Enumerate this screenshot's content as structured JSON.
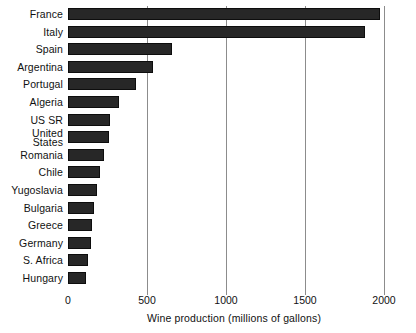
{
  "chart_data": {
    "type": "bar",
    "orientation": "horizontal",
    "title": "",
    "xlabel": "Wine production (millions of gallons)",
    "ylabel": "",
    "xlim": [
      0,
      2000
    ],
    "xticks": [
      0,
      500,
      1000,
      1500,
      2000
    ],
    "xtick_labels": [
      "0",
      "500",
      "1000",
      "1500",
      "2000"
    ],
    "grid": "vertical",
    "legend": "none",
    "bar_color": "#272727",
    "categories": [
      "France",
      "Italy",
      "Spain",
      "Argentina",
      "USSR",
      "Portugal",
      "Algeria",
      "United States",
      "Romania",
      "Chile",
      "Yugoslavia",
      "Bulgaria",
      "Greece",
      "Germany",
      "S. Africa",
      "Hungary"
    ],
    "bars": [
      {
        "label": "France",
        "label_lines": [
          "France"
        ],
        "value": 1975
      },
      {
        "label": "Italy",
        "label_lines": [
          "Italy"
        ],
        "value": 1880
      },
      {
        "label": "Spain",
        "label_lines": [
          "Spain"
        ],
        "value": 660
      },
      {
        "label": "Argentina",
        "label_lines": [
          "Argentina"
        ],
        "value": 540
      },
      {
        "label": "Portugal",
        "label_lines": [
          "Portugal"
        ],
        "value": 430
      },
      {
        "label": "Algeria",
        "label_lines": [
          "Algeria"
        ],
        "value": 320
      },
      {
        "label": "USSR",
        "label_lines": [
          "US SR"
        ],
        "value": 265
      },
      {
        "label": "United States",
        "label_lines": [
          "United",
          "States"
        ],
        "value": 260
      },
      {
        "label": "Romania",
        "label_lines": [
          "Romania"
        ],
        "value": 230
      },
      {
        "label": "Chile",
        "label_lines": [
          "Chile"
        ],
        "value": 205
      },
      {
        "label": "Yugoslavia",
        "label_lines": [
          "Yugoslavia"
        ],
        "value": 185
      },
      {
        "label": "Bulgaria",
        "label_lines": [
          "Bulgaria"
        ],
        "value": 165
      },
      {
        "label": "Greece",
        "label_lines": [
          "Greece"
        ],
        "value": 150
      },
      {
        "label": "Germany",
        "label_lines": [
          "Germany"
        ],
        "value": 145
      },
      {
        "label": "S. Africa",
        "label_lines": [
          "S. Africa"
        ],
        "value": 125
      },
      {
        "label": "Hungary",
        "label_lines": [
          "Hungary"
        ],
        "value": 115
      }
    ]
  }
}
